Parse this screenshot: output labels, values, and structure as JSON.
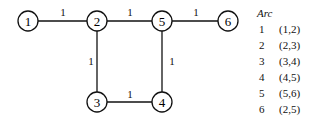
{
  "graph": {
    "nodes": [
      {
        "id": "1",
        "x": 28,
        "y": 21
      },
      {
        "id": "2",
        "x": 97,
        "y": 21
      },
      {
        "id": "5",
        "x": 162,
        "y": 21
      },
      {
        "id": "6",
        "x": 228,
        "y": 21
      },
      {
        "id": "3",
        "x": 97,
        "y": 102
      },
      {
        "id": "4",
        "x": 162,
        "y": 102
      }
    ],
    "edges": [
      {
        "from": "1",
        "to": "2",
        "weight": "1"
      },
      {
        "from": "2",
        "to": "5",
        "weight": "1"
      },
      {
        "from": "5",
        "to": "6",
        "weight": "1"
      },
      {
        "from": "2",
        "to": "3",
        "weight": "1"
      },
      {
        "from": "5",
        "to": "4",
        "weight": "1"
      },
      {
        "from": "3",
        "to": "4",
        "weight": "1"
      }
    ]
  },
  "arc_table": {
    "title": "Arc",
    "rows": [
      {
        "num": "1",
        "arc": "(1,2)"
      },
      {
        "num": "2",
        "arc": "(2,3)"
      },
      {
        "num": "3",
        "arc": "(3,4)"
      },
      {
        "num": "4",
        "arc": "(4,5)"
      },
      {
        "num": "5",
        "arc": "(5,6)"
      },
      {
        "num": "6",
        "arc": "(2,5)"
      }
    ]
  }
}
